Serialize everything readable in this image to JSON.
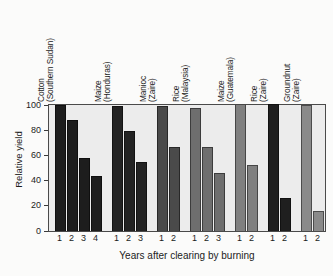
{
  "chart_data": {
    "type": "bar",
    "title": "",
    "xlabel": "Years after clearing by burning",
    "ylabel": "Relative yield",
    "ylim": [
      0,
      100
    ],
    "yticks": [
      0,
      20,
      40,
      60,
      80,
      100
    ],
    "ytick_labels": [
      "0",
      "20",
      "40",
      "60",
      "80",
      "100"
    ],
    "grid": false,
    "legend": "none",
    "groups": [
      {
        "crop": "Cotton",
        "location": "(Southern Sudan)",
        "color": "#1d1d1d",
        "x": [
          "1",
          "2",
          "3",
          "4"
        ],
        "values": [
          100,
          88,
          58,
          44
        ]
      },
      {
        "crop": "Maize",
        "location": "(Honduras)",
        "color": "#232323",
        "x": [
          "1",
          "2",
          "3"
        ],
        "values": [
          99,
          79,
          55
        ]
      },
      {
        "crop": "Manioc",
        "location": "(Zaire)",
        "color": "#4a4a4a",
        "x": [
          "1",
          "2"
        ],
        "values": [
          99,
          67
        ]
      },
      {
        "crop": "Rice",
        "location": "(Malaysia)",
        "color": "#6e6e6e",
        "x": [
          "1",
          "2",
          "3"
        ],
        "values": [
          98,
          67,
          46
        ]
      },
      {
        "crop": "Maize",
        "location": "(Guatemala)",
        "color": "#808080",
        "x": [
          "1",
          "2"
        ],
        "values": [
          101,
          52
        ]
      },
      {
        "crop": "Rice",
        "location": "(Zaire)",
        "color": "#1f1f1f",
        "x": [
          "1",
          "2"
        ],
        "values": [
          101,
          26
        ]
      },
      {
        "crop": "Groundnut",
        "location": "(Zaire)",
        "color": "#8a8a8a",
        "x": [
          "1",
          "2"
        ],
        "values": [
          100,
          16
        ]
      }
    ]
  },
  "style": {
    "plot_background": "#ececec",
    "page_background": "#fbfbfa",
    "axis_color": "#4a4a4a"
  }
}
